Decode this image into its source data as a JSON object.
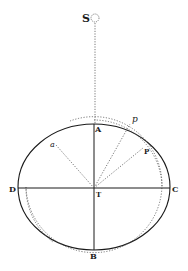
{
  "diagram": {
    "type": "geometric-orbit-figure",
    "labels": {
      "S": "S",
      "A": "A",
      "B": "B",
      "C": "C",
      "D": "D",
      "T": "T",
      "P": "P",
      "p": "p",
      "a": "a"
    },
    "colors": {
      "ink": "#1a1a1a",
      "dotted": "#555555",
      "background": "#ffffff"
    },
    "elements": [
      "ellipse ACBD centered at T",
      "major axis D-C (solid)",
      "minor axis A-B (solid)",
      "dotted line S to A",
      "small circle at S",
      "dotted circle arc centered at T",
      "dotted lines T-a, T-p, T-P"
    ]
  }
}
